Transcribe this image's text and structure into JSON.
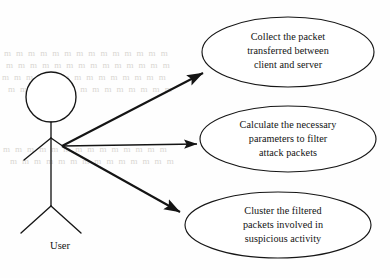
{
  "diagram": {
    "type": "uml-use-case-diagram",
    "background_color": "#fefefe",
    "line_color": "#161616",
    "text_color": "#131313",
    "actor": {
      "label": "User",
      "shape": "stick-figure"
    },
    "use_cases": [
      {
        "id": "collect-packet",
        "lines": [
          "Collect the packet",
          "transferred between",
          "client and server"
        ],
        "cx": 288,
        "cy": 52,
        "rx": 86,
        "ry": 35
      },
      {
        "id": "calculate-parameters",
        "lines": [
          "Calculate the necessary",
          "parameters to filter",
          "attack packets"
        ],
        "cx": 288,
        "cy": 139,
        "rx": 88,
        "ry": 33
      },
      {
        "id": "cluster-packets",
        "lines": [
          "Cluster the filtered",
          "packets involved in",
          "suspicious activity"
        ],
        "cx": 278,
        "cy": 225,
        "rx": 93,
        "ry": 33
      }
    ],
    "associations": [
      {
        "id": "actor-to-collect-packet",
        "from": "User",
        "to": "Collect the packet transferred between client and server"
      },
      {
        "id": "actor-to-calculate-parameters",
        "from": "User",
        "to": "Calculate the necessary parameters to filter attack packets"
      },
      {
        "id": "actor-to-cluster-packets",
        "from": "User",
        "to": "Cluster the filtered packets involved in suspicious activity"
      }
    ]
  }
}
